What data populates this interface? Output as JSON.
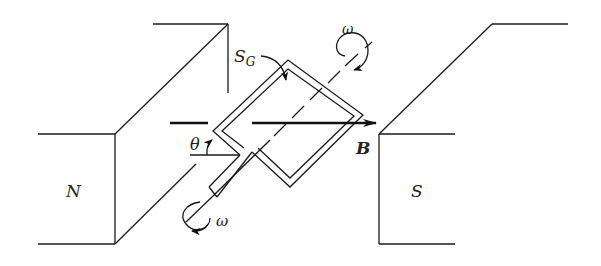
{
  "diagram": {
    "type": "physics-schematic",
    "labels": {
      "north_pole": "N",
      "south_pole": "S",
      "field": "B",
      "surface": "S",
      "surface_sub": "G",
      "angle": "θ",
      "omega_top": "ω",
      "omega_bottom": "ω"
    },
    "colors": {
      "stroke": "#1a1a1a",
      "background": "#ffffff"
    }
  }
}
